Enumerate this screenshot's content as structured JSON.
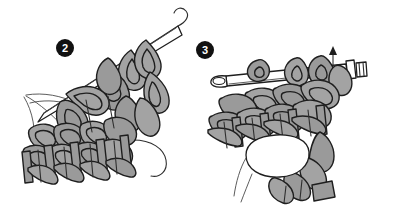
{
  "illustration": {
    "title": "Crochet stitch instruction steps",
    "type": "line-drawing-diagram",
    "background_color": "#ffffff",
    "palette": {
      "yarn_fill": "#a3a3a3",
      "yarn_fill_shadow": "#8e8e8e",
      "outline": "#1e1e1e",
      "thin_line": "#4a4a4a",
      "hook_fill": "#ffffff",
      "hand_fill": "#ffffff",
      "badge_fill": "#111111",
      "badge_text": "#ffffff"
    },
    "panels": [
      {
        "id": "step-2",
        "badge_number": "2",
        "badge_x": 65,
        "badge_y": 48,
        "badge_radius": 9,
        "caption": "",
        "elements": [
          "crochet-hook-diagonal",
          "yarn-loops-on-hook",
          "crochet-fabric-rows",
          "hand-outline",
          "working-yarn-strand"
        ]
      },
      {
        "id": "step-3",
        "badge_number": "3",
        "badge_x": 205,
        "badge_y": 50,
        "badge_radius": 9,
        "caption": "",
        "elements": [
          "crochet-hook-horizontal",
          "hook-thumb-rest",
          "direction-arrow-up",
          "crochet-fabric-rows",
          "thumb-outline",
          "hanging-yarn-tail"
        ]
      }
    ],
    "annotations": [
      {
        "name": "direction-arrow-up",
        "panel": "step-3",
        "x": 333,
        "y": 52,
        "direction": "up",
        "label": ""
      }
    ]
  }
}
